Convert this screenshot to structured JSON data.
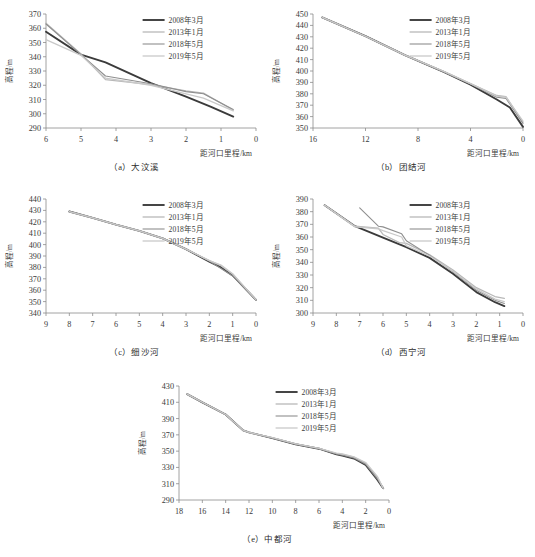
{
  "figure": {
    "axis_titles": {
      "x": "距河口里程/km",
      "y": "高程/m"
    },
    "legend": [
      {
        "label": "2008年3月",
        "color": "#3b3b3b",
        "width": 1.9
      },
      {
        "label": "2013年1月",
        "color": "#b8b8b8",
        "width": 1.3
      },
      {
        "label": "2018年5月",
        "color": "#8f8f8f",
        "width": 1.1
      },
      {
        "label": "2019年5月",
        "color": "#c9c9c9",
        "width": 1.3
      }
    ],
    "captions": {
      "a": "（a）大汶溪",
      "b": "（b）团结河",
      "c": "（c）细沙河",
      "d": "（d）西宁河",
      "e": "（e）中都河"
    }
  },
  "chart_data": [
    {
      "id": "a",
      "type": "line",
      "title": "（a）大汶溪",
      "xlabel": "距河口里程/km",
      "ylabel": "高程/m",
      "xlim": [
        6,
        0
      ],
      "ylim": [
        290,
        370
      ],
      "xticks": [
        6,
        5,
        4,
        3,
        2,
        1,
        0
      ],
      "yticks": [
        290,
        300,
        310,
        320,
        330,
        340,
        350,
        360,
        370
      ],
      "x_reversed": true,
      "grid": false,
      "legend_position": "top-right",
      "series": [
        {
          "name": "2008年3月",
          "color": "#3b3b3b",
          "x": [
            6.0,
            5.0,
            4.3,
            3.0,
            2.0,
            1.3,
            0.65
          ],
          "y": [
            357.5,
            341.5,
            336.0,
            321.5,
            312.0,
            305.0,
            298.0
          ]
        },
        {
          "name": "2013年1月",
          "color": "#b8b8b8",
          "x": [
            6.0,
            5.0,
            4.3,
            3.0,
            2.0,
            1.5,
            0.65
          ],
          "y": [
            363.5,
            342.0,
            324.0,
            320.5,
            316.0,
            314.5,
            302.5
          ]
        },
        {
          "name": "2018年5月",
          "color": "#8f8f8f",
          "x": [
            6.0,
            5.0,
            4.3,
            3.0,
            2.0,
            1.5,
            0.65
          ],
          "y": [
            363.0,
            341.5,
            326.5,
            321.0,
            315.5,
            314.0,
            303.0
          ]
        },
        {
          "name": "2019年5月",
          "color": "#c9c9c9",
          "x": [
            6.0,
            5.0,
            4.3,
            3.0,
            2.0,
            1.5,
            0.65
          ],
          "y": [
            352.0,
            341.0,
            325.0,
            320.0,
            314.0,
            311.0,
            302.0
          ]
        }
      ]
    },
    {
      "id": "b",
      "type": "line",
      "title": "（b）团结河",
      "xlabel": "距河口里程/km",
      "ylabel": "高程/m",
      "xlim": [
        16,
        0
      ],
      "ylim": [
        350,
        450
      ],
      "xticks": [
        16,
        12,
        8,
        4,
        0
      ],
      "yticks": [
        350,
        360,
        370,
        380,
        390,
        400,
        410,
        420,
        430,
        440,
        450
      ],
      "x_reversed": true,
      "grid": false,
      "legend_position": "top-right",
      "series": [
        {
          "name": "2008年3月",
          "color": "#3b3b3b",
          "x": [
            15.3,
            12.0,
            9.0,
            6.0,
            4.0,
            2.0,
            1.0,
            0.0
          ],
          "y": [
            447.0,
            430.5,
            414.0,
            399.0,
            388.0,
            375.0,
            368.0,
            351.0
          ]
        },
        {
          "name": "2013年1月",
          "color": "#b8b8b8",
          "x": [
            15.3,
            12.0,
            9.0,
            6.0,
            4.0,
            2.0,
            1.3,
            0.0
          ],
          "y": [
            447.0,
            430.5,
            414.0,
            399.5,
            389.0,
            378.5,
            377.5,
            355.0
          ]
        },
        {
          "name": "2018年5月",
          "color": "#8f8f8f",
          "x": [
            15.3,
            12.0,
            9.0,
            6.0,
            4.0,
            2.0,
            1.3,
            0.0
          ],
          "y": [
            447.0,
            430.5,
            414.0,
            399.0,
            388.5,
            377.0,
            376.0,
            354.0
          ]
        },
        {
          "name": "2019年5月",
          "color": "#c9c9c9",
          "x": [
            15.3,
            12.0,
            9.0,
            6.0,
            4.0,
            2.0,
            1.3,
            0.0
          ],
          "y": [
            447.0,
            430.5,
            414.0,
            399.5,
            389.0,
            378.0,
            377.0,
            356.0
          ]
        }
      ]
    },
    {
      "id": "c",
      "type": "line",
      "title": "（c）细沙河",
      "xlabel": "距河口里程/km",
      "ylabel": "高程/m",
      "xlim": [
        9,
        0
      ],
      "ylim": [
        340,
        440
      ],
      "xticks": [
        9,
        8,
        7,
        6,
        5,
        4,
        3,
        2,
        1,
        0
      ],
      "yticks": [
        340,
        350,
        360,
        370,
        380,
        390,
        400,
        410,
        420,
        430,
        440
      ],
      "x_reversed": true,
      "grid": false,
      "legend_position": "top-right",
      "series": [
        {
          "name": "2008年3月",
          "color": "#3b3b3b",
          "x": [
            8.0,
            7.0,
            6.0,
            5.0,
            4.0,
            3.0,
            2.0,
            1.5,
            1.0,
            0.0
          ],
          "y": [
            429.0,
            423.5,
            417.5,
            412.0,
            405.5,
            396.0,
            385.0,
            380.0,
            373.0,
            351.5
          ]
        },
        {
          "name": "2013年1月",
          "color": "#b8b8b8",
          "x": [
            8.0,
            7.0,
            6.0,
            5.0,
            4.0,
            3.0,
            2.0,
            1.5,
            1.0,
            0.0
          ],
          "y": [
            429.0,
            423.5,
            417.5,
            412.0,
            405.5,
            396.0,
            386.0,
            381.5,
            374.0,
            351.5
          ]
        },
        {
          "name": "2018年5月",
          "color": "#8f8f8f",
          "x": [
            8.0,
            7.0,
            6.0,
            5.0,
            4.0,
            3.0,
            2.0,
            1.5,
            1.0,
            0.0
          ],
          "y": [
            429.0,
            423.5,
            417.5,
            412.0,
            405.5,
            396.0,
            385.5,
            379.0,
            372.5,
            351.5
          ]
        },
        {
          "name": "2019年5月",
          "color": "#c9c9c9",
          "x": [
            8.0,
            7.0,
            6.0,
            5.0,
            4.0,
            3.0,
            2.0,
            1.5,
            1.0,
            0.0
          ],
          "y": [
            429.0,
            423.5,
            417.5,
            412.0,
            405.5,
            396.0,
            386.0,
            382.0,
            374.5,
            351.5
          ]
        }
      ]
    },
    {
      "id": "d",
      "type": "line",
      "title": "（d）西宁河",
      "xlabel": "距河口里程/km",
      "ylabel": "高程/m",
      "xlim": [
        9,
        0
      ],
      "ylim": [
        300,
        390
      ],
      "xticks": [
        9,
        8,
        7,
        6,
        5,
        4,
        3,
        2,
        1,
        0
      ],
      "yticks": [
        300,
        310,
        320,
        330,
        340,
        350,
        360,
        370,
        380,
        390
      ],
      "x_reversed": true,
      "grid": false,
      "legend_position": "top-right",
      "series": [
        {
          "name": "2008年3月",
          "color": "#3b3b3b",
          "x": [
            8.5,
            7.2,
            6.0,
            5.0,
            4.0,
            3.0,
            2.0,
            1.2,
            0.8
          ],
          "y": [
            385.0,
            368.5,
            359.5,
            352.0,
            343.5,
            331.0,
            316.5,
            308.5,
            305.5
          ]
        },
        {
          "name": "2013年1月",
          "color": "#b8b8b8",
          "x": [
            8.5,
            7.2,
            6.2,
            6.0,
            5.3,
            5.0,
            4.0,
            3.0,
            2.0,
            1.2,
            0.8
          ],
          "y": [
            385.0,
            368.5,
            367.0,
            362.0,
            355.5,
            355.0,
            346.0,
            334.0,
            320.0,
            313.0,
            311.5
          ]
        },
        {
          "name": "2018年5月",
          "color": "#8f8f8f",
          "x": [
            7.0,
            6.2,
            6.0,
            5.2,
            5.0,
            4.0,
            3.0,
            2.0,
            1.2,
            0.8
          ],
          "y": [
            383.0,
            368.5,
            368.0,
            362.5,
            357.0,
            345.5,
            332.5,
            318.0,
            310.0,
            307.5
          ]
        },
        {
          "name": "2019年5月",
          "color": "#c9c9c9",
          "x": [
            8.5,
            7.2,
            6.2,
            6.0,
            5.2,
            5.0,
            4.0,
            3.0,
            2.0,
            1.2,
            0.8
          ],
          "y": [
            385.0,
            368.0,
            366.5,
            365.0,
            360.0,
            353.0,
            345.0,
            333.0,
            319.0,
            311.0,
            309.0
          ]
        }
      ]
    },
    {
      "id": "e",
      "type": "line",
      "title": "（e）中都河",
      "xlabel": "距河口里程/km",
      "ylabel": "高程/m",
      "xlim": [
        18,
        0
      ],
      "ylim": [
        290,
        430
      ],
      "xticks": [
        18,
        16,
        14,
        12,
        10,
        8,
        6,
        4,
        2,
        0
      ],
      "yticks": [
        290,
        310,
        330,
        350,
        370,
        390,
        410,
        430
      ],
      "x_reversed": true,
      "grid": false,
      "legend_position": "top-right",
      "series": [
        {
          "name": "2008年3月",
          "color": "#3b3b3b",
          "x": [
            17.3,
            16.0,
            14.0,
            12.5,
            12.0,
            10.0,
            8.0,
            6.0,
            4.5,
            4.0,
            3.0,
            2.0,
            1.0,
            0.5
          ],
          "y": [
            420.0,
            410.0,
            395.0,
            375.5,
            373.0,
            366.0,
            358.5,
            353.0,
            346.0,
            344.5,
            341.0,
            333.0,
            315.0,
            304.5
          ]
        },
        {
          "name": "2013年1月",
          "color": "#b8b8b8",
          "x": [
            17.3,
            16.0,
            14.0,
            12.5,
            12.0,
            10.0,
            8.0,
            6.0,
            4.5,
            4.0,
            3.0,
            2.0,
            1.0,
            0.5
          ],
          "y": [
            420.0,
            410.0,
            395.0,
            375.5,
            373.0,
            366.5,
            359.0,
            353.5,
            347.0,
            346.0,
            342.5,
            335.0,
            318.0,
            304.5
          ]
        },
        {
          "name": "2018年5月",
          "color": "#8f8f8f",
          "x": [
            17.3,
            16.0,
            14.0,
            12.5,
            12.0,
            10.0,
            8.0,
            6.0,
            4.5,
            4.0,
            3.0,
            2.0,
            1.0,
            0.5
          ],
          "y": [
            420.0,
            410.0,
            395.0,
            375.5,
            373.0,
            366.0,
            358.5,
            353.0,
            346.5,
            345.0,
            341.5,
            334.0,
            316.0,
            304.5
          ]
        },
        {
          "name": "2019年5月",
          "color": "#c9c9c9",
          "x": [
            17.3,
            16.0,
            14.0,
            12.5,
            12.0,
            10.0,
            8.0,
            6.0,
            4.5,
            4.0,
            3.0,
            2.0,
            1.0,
            0.5
          ],
          "y": [
            420.0,
            410.0,
            395.0,
            375.5,
            373.0,
            366.5,
            359.0,
            353.5,
            347.5,
            346.5,
            343.0,
            336.0,
            319.0,
            304.5
          ]
        }
      ]
    }
  ]
}
